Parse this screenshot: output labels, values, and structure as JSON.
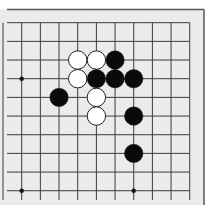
{
  "board": {
    "background": "#ebebeb",
    "line_color": "#3a3a3a",
    "frame_color": "#555555",
    "grid": {
      "origin_x": 21.7,
      "origin_y": 22.7,
      "spacing": 18.67,
      "cols": 10,
      "rows": 10,
      "line_start_x": 7,
      "line_end_y": 200
    },
    "frame": {
      "top_y": 9.5,
      "right_x": 204
    },
    "stone_radius": 9.2,
    "star_points": [
      {
        "col": 0,
        "row": 3
      },
      {
        "col": 0,
        "row": 9
      },
      {
        "col": 6,
        "row": 9
      }
    ],
    "stones": [
      {
        "color": "white",
        "col": 3,
        "row": 2
      },
      {
        "color": "white",
        "col": 4,
        "row": 2
      },
      {
        "color": "black",
        "col": 5,
        "row": 2
      },
      {
        "color": "white",
        "col": 3,
        "row": 3
      },
      {
        "color": "black",
        "col": 4,
        "row": 3
      },
      {
        "color": "black",
        "col": 5,
        "row": 3
      },
      {
        "color": "black",
        "col": 6,
        "row": 3
      },
      {
        "color": "black",
        "col": 2,
        "row": 4
      },
      {
        "color": "white",
        "col": 4,
        "row": 4
      },
      {
        "color": "white",
        "col": 4,
        "row": 5
      },
      {
        "color": "black",
        "col": 6,
        "row": 5
      },
      {
        "color": "black",
        "col": 6,
        "row": 7
      }
    ]
  }
}
